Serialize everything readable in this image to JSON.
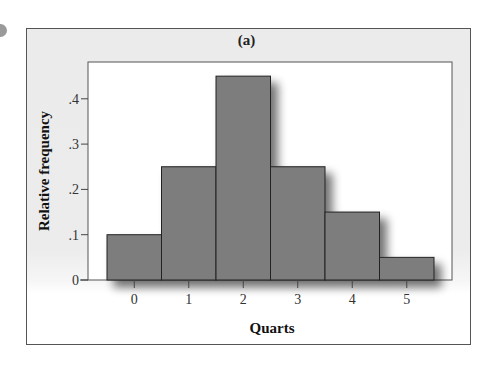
{
  "chart_data": {
    "type": "bar",
    "subtype": "histogram",
    "title": "(a)",
    "xlabel": "Quarts",
    "ylabel": "Relative frequency",
    "categories": [
      "0",
      "1",
      "2",
      "3",
      "4",
      "5"
    ],
    "values": [
      0.1,
      0.25,
      0.45,
      0.25,
      0.15,
      0.05
    ],
    "ylim": [
      0,
      0.45
    ],
    "yticks": [
      0,
      0.1,
      0.2,
      0.3,
      0.4
    ],
    "ytick_labels": [
      "0",
      ".1",
      ".2",
      ".3",
      ".4"
    ],
    "grid": false,
    "legend": null,
    "bar_color": "#7d7d7d",
    "bar_edge_color": "#222222"
  },
  "panel": {
    "title": "(a)"
  }
}
